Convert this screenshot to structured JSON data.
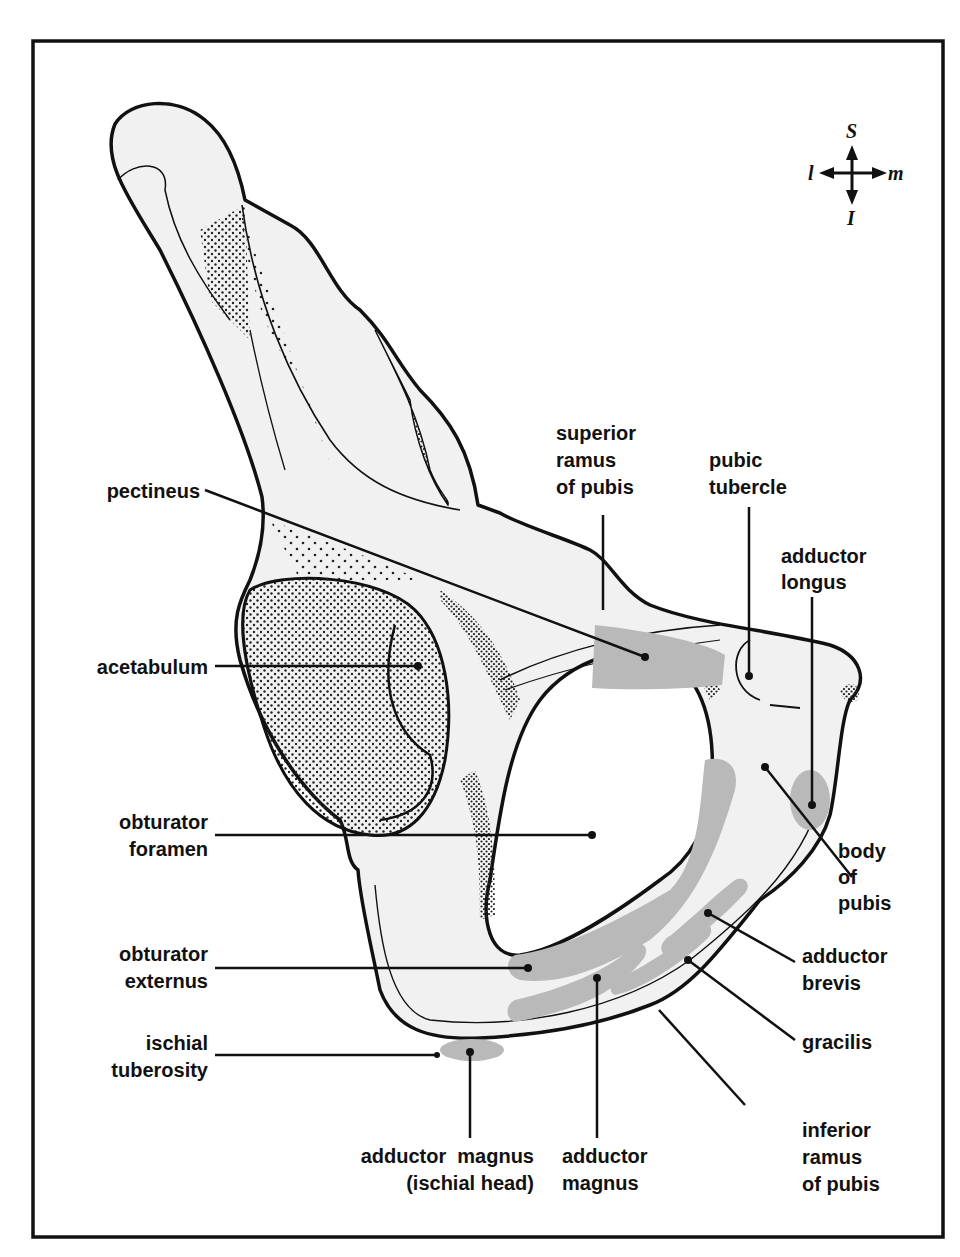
{
  "figure": {
    "colors": {
      "outline": "#111111",
      "bone_fill": "#f1f1f1",
      "muscle_attachment": "#b9b9b9",
      "stipple": "#222222",
      "background": "#ffffff"
    }
  },
  "compass": {
    "superior": "S",
    "inferior": "I",
    "lateral": "l",
    "medial": "m"
  },
  "labels": {
    "pectineus": [
      "pectineus"
    ],
    "acetabulum": [
      "acetabulum"
    ],
    "obturator_foramen": [
      "obturator",
      "foramen"
    ],
    "obturator_externus": [
      "obturator",
      "externus"
    ],
    "ischial_tuberosity": [
      "ischial",
      "tuberosity"
    ],
    "superior_ramus": [
      "superior",
      "ramus",
      "of pubis"
    ],
    "pubic_tubercle": [
      "pubic",
      "tubercle"
    ],
    "adductor_longus": [
      "adductor",
      "longus"
    ],
    "body_of_pubis": [
      "body",
      "of",
      "pubis"
    ],
    "adductor_brevis": [
      "adductor",
      "brevis"
    ],
    "gracilis": [
      "gracilis"
    ],
    "inferior_ramus": [
      "inferior",
      "ramus",
      "of pubis"
    ],
    "adductor_magnus_ischial": [
      "adductor  magnus",
      "(ischial head)"
    ],
    "adductor_magnus": [
      "adductor",
      "magnus"
    ]
  }
}
